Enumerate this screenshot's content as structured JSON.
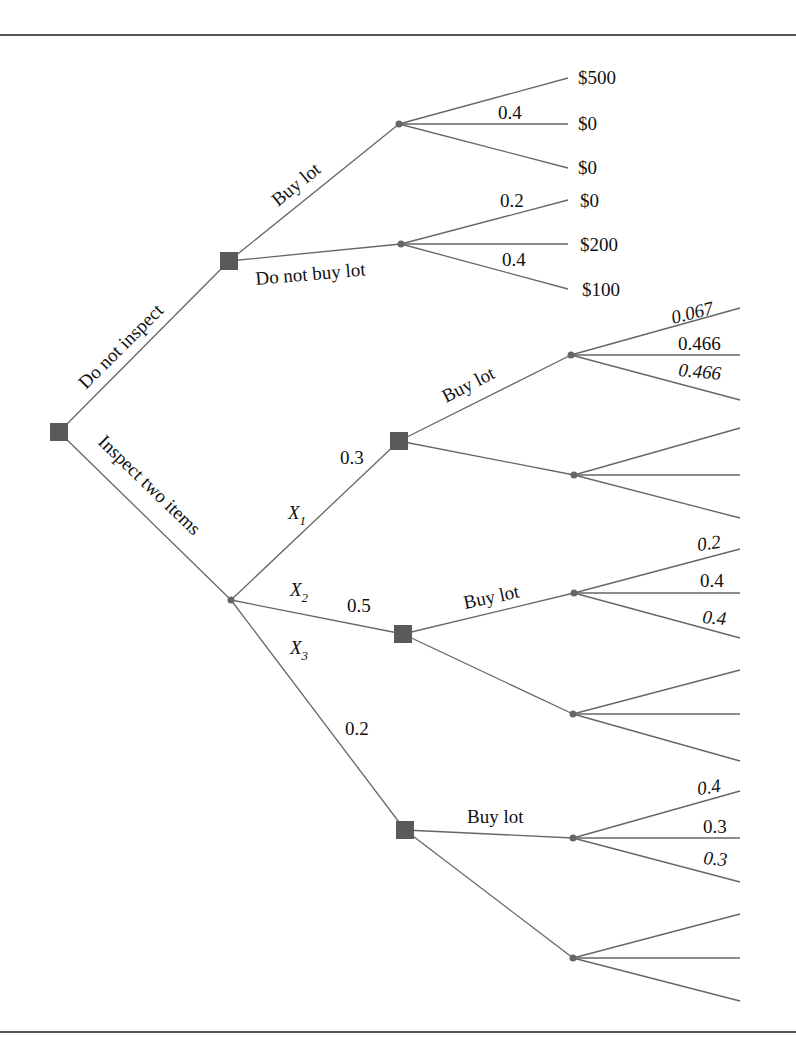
{
  "diagram": {
    "type": "decision-tree",
    "root": {
      "label": "decision",
      "branches": {
        "do_not_inspect": "Do not inspect",
        "inspect_two": "Inspect two items"
      }
    },
    "no_inspect_node": {
      "buy_lot": "Buy lot",
      "do_not_buy_lot": "Do not buy lot",
      "buy_chance": {
        "prob_mid": "0.4",
        "payoffs": [
          "$500",
          "$0",
          "$0"
        ]
      },
      "no_buy_chance": {
        "prob_top": "0.2",
        "prob_bottom": "0.4",
        "payoffs": [
          "$0",
          "$200",
          "$100"
        ]
      }
    },
    "inspect_chance": {
      "outcomes": [
        {
          "var": "X",
          "sub": "1",
          "prob": "0.3"
        },
        {
          "var": "X",
          "sub": "2",
          "prob": "0.5"
        },
        {
          "var": "X",
          "sub": "3",
          "prob": "0.2"
        }
      ]
    },
    "sub_decisions": [
      {
        "buy_label": "Buy lot",
        "probs": [
          "0.067",
          "0.466",
          "0.466"
        ]
      },
      {
        "buy_label": "Buy lot",
        "probs": [
          "0.2",
          "0.4",
          "0.4"
        ]
      },
      {
        "buy_label": "Buy lot",
        "probs": [
          "0.4",
          "0.3",
          "0.3"
        ]
      }
    ]
  }
}
